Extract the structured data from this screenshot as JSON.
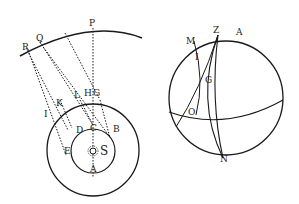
{
  "figure_left": {
    "title": "Aberration of starlight / orbit diagram",
    "labels": {
      "R": "R",
      "Q": "Q",
      "P": "P",
      "K": "K",
      "L": "L",
      "H": "H",
      "G": "G",
      "I": "I",
      "D": "D",
      "C": "C",
      "B": "B",
      "E": "E",
      "S": "S",
      "A": "A"
    }
  },
  "figure_right": {
    "title": "Celestial sphere diagram",
    "labels": {
      "M": "M",
      "Z": "Z",
      "A": "A",
      "I": "I",
      "G": "G",
      "O": "O",
      "N": "N"
    }
  },
  "colors": {
    "ink": "#1a1a1a",
    "paper": "#ffffff"
  }
}
